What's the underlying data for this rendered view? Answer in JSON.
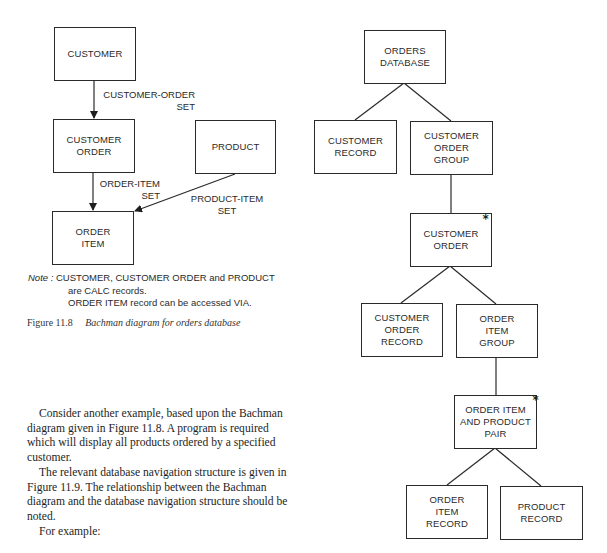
{
  "figure_11_8": {
    "boxes": {
      "customer": "CUSTOMER",
      "customer_order": "CUSTOMER\nORDER",
      "product": "PRODUCT",
      "order_item": "ORDER\nITEM"
    },
    "sets": {
      "customer_order_set": "CUSTOMER-ORDER\nSET",
      "order_item_set": "ORDER-ITEM\nSET",
      "product_item_set": "PRODUCT-ITEM\nSET"
    },
    "note": {
      "key": "Note :",
      "line1": "CUSTOMER, CUSTOMER ORDER and PRODUCT",
      "line2": "are CALC records.",
      "line3": "ORDER ITEM record can be accessed VIA."
    },
    "caption": {
      "number": "Figure 11.8",
      "title": "Bachman diagram for orders database"
    }
  },
  "figure_11_9": {
    "boxes": {
      "orders_database": "ORDERS\nDATABASE",
      "customer_record": "CUSTOMER\nRECORD",
      "customer_order_group": "CUSTOMER\nORDER\nGROUP",
      "customer_order": "CUSTOMER\nORDER",
      "customer_order_record": "CUSTOMER\nORDER\nRECORD",
      "order_item_group": "ORDER\nITEM\nGROUP",
      "order_item_product_pair": "ORDER ITEM\nAND PRODUCT\nPAIR",
      "order_item_record": "ORDER\nITEM\nRECORD",
      "product_record": "PRODUCT\nRECORD"
    },
    "iteration_marker": "*"
  },
  "body": {
    "paragraph1": "Consider another example, based upon the Bachman diagram given in Figure 11.8. A program is required which will display all products ordered by a specified customer.",
    "paragraph2": "The relevant database navigation structure is given in Figure 11.9. The relationship between the Bachman diagram and the database navigation structure should be noted.",
    "paragraph3": "For example:"
  }
}
